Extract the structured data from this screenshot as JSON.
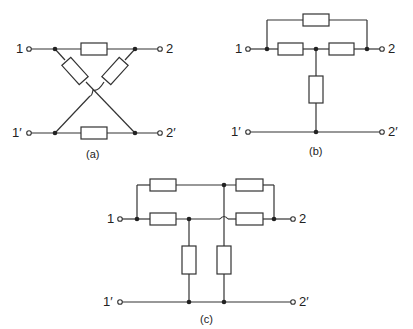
{
  "figures": [
    {
      "id": "a",
      "caption": "(a)",
      "terminals": {
        "t1": "1",
        "t2": "2",
        "t1p": "1′",
        "t2p": "2′"
      },
      "description": "Lattice (X) network"
    },
    {
      "id": "b",
      "caption": "(b)",
      "terminals": {
        "t1": "1",
        "t2": "2",
        "t1p": "1′",
        "t2p": "2′"
      },
      "description": "Bridged-T network"
    },
    {
      "id": "c",
      "caption": "(c)",
      "terminals": {
        "t1": "1",
        "t2": "2",
        "t1p": "1′",
        "t2p": "2′"
      },
      "description": "Parallel-T (twin-T) network"
    }
  ],
  "colors": {
    "line": "#333333",
    "background": "#ffffff"
  }
}
